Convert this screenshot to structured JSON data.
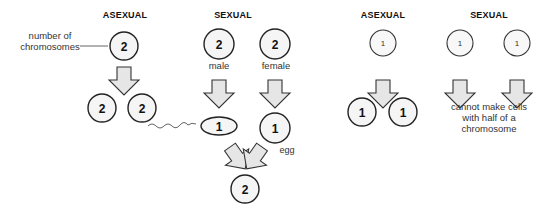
{
  "left_panel": {
    "asexual": {
      "heading": "ASEXUAL",
      "annotation": "number of chromosomes",
      "annotation_lines": [
        "number of",
        "chromosomes"
      ],
      "parent": "2",
      "offspring": [
        "2",
        "2"
      ]
    },
    "sexual": {
      "heading": "SEXUAL",
      "male": {
        "value": "2",
        "label": "male"
      },
      "female": {
        "value": "2",
        "label": "female"
      },
      "sperm": "1",
      "egg": {
        "value": "1",
        "label": "egg"
      },
      "zygote": "2"
    }
  },
  "right_panel": {
    "asexual": {
      "heading": "ASEXUAL",
      "parent": "1",
      "offspring": [
        "1",
        "1"
      ]
    },
    "sexual": {
      "heading": "SEXUAL",
      "parents": [
        "1",
        "1"
      ],
      "result_lines": [
        "cannot make cells",
        "with half of a",
        "chromosome"
      ]
    }
  },
  "colors": {
    "outline": "#222222",
    "cell_fill": "#f5f5f5",
    "arrow_fill": "#e6e6e6",
    "text": "#333333"
  }
}
